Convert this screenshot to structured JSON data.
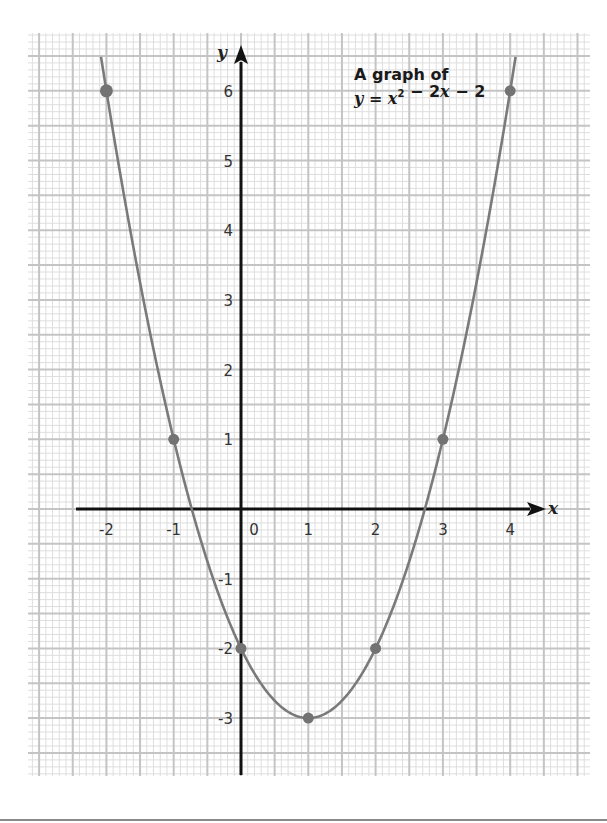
{
  "chart_data": {
    "type": "line",
    "title": "A graph of",
    "subtitle": "y = x² − 2x − 2",
    "equation": {
      "a": 1,
      "b": -2,
      "c": -2
    },
    "xlabel": "x",
    "ylabel": "y",
    "xlim": [
      -2.5,
      5.2
    ],
    "ylim": [
      -3.9,
      6.8
    ],
    "x_ticks": [
      -2,
      -1,
      0,
      1,
      2,
      3,
      4
    ],
    "x_tick_labels": [
      "-2",
      "-1",
      "0",
      "1",
      "2",
      "3",
      "4"
    ],
    "y_ticks": [
      6,
      5,
      4,
      3,
      2,
      1,
      -1,
      -2,
      -3
    ],
    "y_tick_labels": [
      "6",
      "5",
      "4",
      "3",
      "2",
      "1",
      "-1",
      "-2",
      "-3"
    ],
    "grid": true,
    "grid_style": "graph paper (major every 0.5 unit, minor every 0.1 unit)",
    "curve_domain": [
      -2.08,
      4.08
    ],
    "series": [
      {
        "name": "y = x² − 2x − 2",
        "x": [
          -2,
          -1,
          0,
          1,
          2,
          3,
          4
        ],
        "y": [
          6,
          1,
          -2,
          -3,
          -2,
          1,
          6
        ]
      }
    ],
    "colors": {
      "curve": "#7a7a7a",
      "points": "#737373",
      "axis": "#111111",
      "grid_major": "#c4c4c4",
      "grid_minor": "#dedede"
    }
  },
  "layout": {
    "origin_px": [
      241,
      509
    ],
    "unit_px_x": 67.3,
    "unit_px_y": 69.7,
    "grid_box": [
      28,
      33,
      590,
      776
    ]
  }
}
